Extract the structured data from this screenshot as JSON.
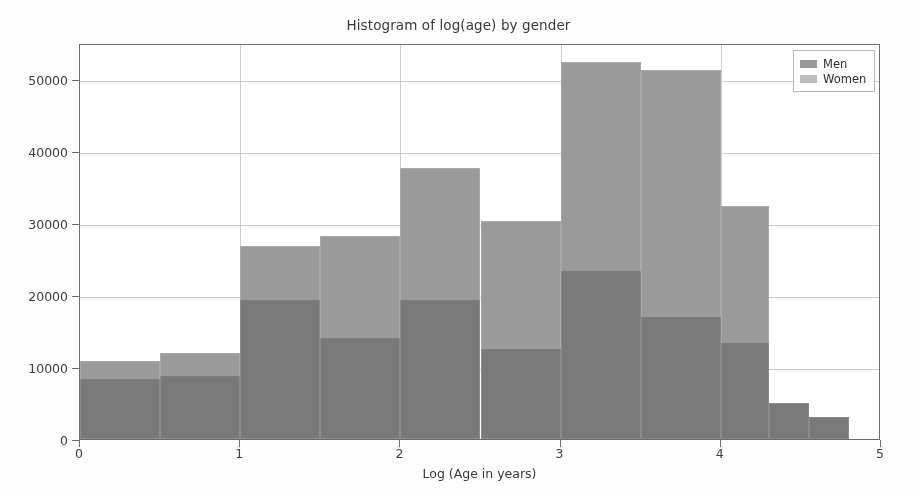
{
  "chart_data": {
    "type": "bar",
    "subtype": "histogram-overlapping",
    "title": "Histogram of log(age) by gender",
    "xlabel": "Log (Age in years)",
    "ylabel": "",
    "xlim": [
      0,
      5
    ],
    "ylim": [
      0,
      55000
    ],
    "xticks": [
      "0",
      "1",
      "2",
      "3",
      "4",
      "5"
    ],
    "xtick_values": [
      0,
      1,
      2,
      3,
      4,
      5
    ],
    "yticks": [
      "0",
      "10000",
      "20000",
      "30000",
      "40000",
      "50000"
    ],
    "ytick_values": [
      0,
      10000,
      20000,
      30000,
      40000,
      50000
    ],
    "grid": true,
    "legend_position": "upper right",
    "bin_width": 0.5,
    "bin_edges": [
      0.0,
      0.5,
      1.0,
      1.5,
      2.0,
      2.5,
      3.0,
      3.5,
      4.0,
      4.3,
      4.55,
      4.8
    ],
    "bins": [
      {
        "start": 0.0,
        "end": 0.5
      },
      {
        "start": 0.5,
        "end": 1.0
      },
      {
        "start": 1.0,
        "end": 1.5
      },
      {
        "start": 1.5,
        "end": 2.0
      },
      {
        "start": 2.0,
        "end": 2.5
      },
      {
        "start": 2.5,
        "end": 3.0
      },
      {
        "start": 3.0,
        "end": 3.5
      },
      {
        "start": 3.5,
        "end": 4.0
      },
      {
        "start": 4.0,
        "end": 4.3
      },
      {
        "start": 4.3,
        "end": 4.55
      },
      {
        "start": 4.55,
        "end": 4.8
      }
    ],
    "series": [
      {
        "name": "Men",
        "color": "#9a9a9a",
        "values": [
          10800,
          11900,
          26800,
          28200,
          37700,
          30300,
          52300,
          51200,
          32400,
          5000,
          3000
        ]
      },
      {
        "name": "Women",
        "color": "#bdbdbd",
        "values": [
          8400,
          8700,
          19300,
          14000,
          19300,
          12500,
          23400,
          17000,
          13300,
          5000,
          3000
        ]
      }
    ]
  },
  "legend": {
    "items": [
      {
        "label": "Men"
      },
      {
        "label": "Women"
      }
    ]
  }
}
